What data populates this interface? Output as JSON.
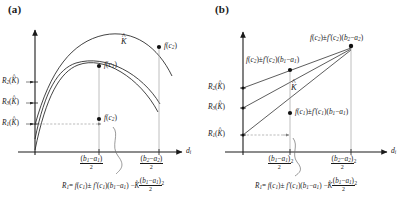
{
  "figure": {
    "panels": [
      {
        "id": "a",
        "label": "(a)",
        "axis_x_label": "d",
        "axis_x_sub": "i",
        "y_ticks": [
          {
            "name": "R2",
            "base": "R",
            "sub": "2",
            "arg": "K"
          },
          {
            "name": "R3",
            "base": "R",
            "sub": "3",
            "arg": "K"
          },
          {
            "name": "R1",
            "base": "R",
            "sub": "1",
            "arg": "K"
          }
        ],
        "x_ticks": [
          {
            "name": "x-tick-1",
            "num": "(b₁−a₁)",
            "den": "2",
            "sup": ""
          },
          {
            "name": "x-tick-2",
            "num": "(b₂−a₂)",
            "den": "2",
            "sup": ""
          }
        ],
        "curve_label": {
          "base": "K",
          "hat": true
        },
        "point_labels": [
          {
            "name": "point-f-c1",
            "text": "f(c₁)"
          },
          {
            "name": "point-f-c2",
            "text": "f(c₂)"
          },
          {
            "name": "point-f-c3",
            "text": "f(c₂)"
          }
        ],
        "formula": "R₁ = f(c₁) ± f′(c₁)(b₁−a₁) − K̂(b₁−a₁)²/2"
      },
      {
        "id": "b",
        "label": "(b)",
        "axis_x_label": "d",
        "axis_x_sub": "i",
        "y_ticks": [
          {
            "name": "R2",
            "base": "R",
            "sub": "2",
            "arg": "K"
          },
          {
            "name": "R3",
            "base": "R",
            "sub": "3",
            "arg": "K"
          },
          {
            "name": "R1",
            "base": "R",
            "sub": "1",
            "arg": "K"
          }
        ],
        "x_ticks": [
          {
            "name": "x-tick-1",
            "num": "(b₁−a₁)",
            "den": "2",
            "sup": "2"
          },
          {
            "name": "x-tick-2",
            "num": "(b₂−a₂)",
            "den": "2",
            "sup": "2"
          }
        ],
        "curve_label": {
          "base": "K",
          "hat": true
        },
        "point_labels": [
          {
            "name": "point-top",
            "text": "f(c₂) ± f′(c₂)(b₂−a₂)"
          },
          {
            "name": "point-mid",
            "text": "f(c₂) ± f′(c₂)(b₁−a₁)"
          },
          {
            "name": "point-low",
            "text": "f(c₁) ± f′(c₁)(b₁−a₁)"
          }
        ],
        "formula": "R₁ = f(c₁) ± f′(c₁)(b₁−a₁) − K̂(b₁−a₁)²/2"
      }
    ],
    "colors": {
      "ink": "#1a1a1a",
      "guide": "#8a8a8a",
      "curve": "#222222"
    }
  }
}
